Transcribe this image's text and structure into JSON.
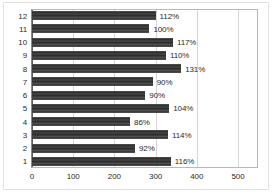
{
  "chart_data": {
    "type": "bar",
    "orientation": "horizontal",
    "title": "",
    "xlabel": "",
    "ylabel": "",
    "categories": [
      "1",
      "2",
      "3",
      "4",
      "5",
      "6",
      "7",
      "8",
      "9",
      "10",
      "11",
      "12"
    ],
    "values": [
      337,
      250,
      330,
      238,
      333,
      275,
      293,
      362,
      325,
      342,
      285,
      300
    ],
    "data_labels": [
      "116%",
      "92%",
      "114%",
      "86%",
      "104%",
      "90%",
      "90%",
      "131%",
      "110%",
      "117%",
      "100%",
      "112%"
    ],
    "xlim": [
      0,
      500
    ],
    "xticks": [
      0,
      100,
      200,
      300,
      400,
      500
    ],
    "xtick_labels": [
      "0",
      "100",
      "200",
      "300",
      "400",
      "500"
    ],
    "ylim": [
      0.5,
      12.5
    ],
    "grid": "vertical",
    "legend": "none",
    "bar_color": "#3f3f3f",
    "gridline_color": "#d6d6d6",
    "axis_color": "#5f5f5f",
    "background": "#ffffff",
    "bars": [
      {
        "category": "12",
        "value": 300,
        "label": "112%"
      },
      {
        "category": "11",
        "value": 285,
        "label": "100%"
      },
      {
        "category": "10",
        "value": 342,
        "label": "117%"
      },
      {
        "category": "9",
        "value": 325,
        "label": "110%"
      },
      {
        "category": "8",
        "value": 362,
        "label": "131%"
      },
      {
        "category": "7",
        "value": 293,
        "label": "90%"
      },
      {
        "category": "6",
        "value": 275,
        "label": "90%"
      },
      {
        "category": "5",
        "value": 333,
        "label": "104%"
      },
      {
        "category": "4",
        "value": 238,
        "label": "86%"
      },
      {
        "category": "3",
        "value": 330,
        "label": "114%"
      },
      {
        "category": "2",
        "value": 250,
        "label": "92%"
      },
      {
        "category": "1",
        "value": 337,
        "label": "116%"
      }
    ]
  }
}
